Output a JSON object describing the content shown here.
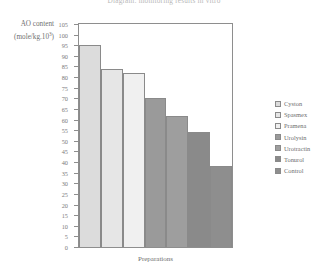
{
  "chart_data": {
    "type": "bar",
    "title": "Diagram: monitoring results in vitro",
    "xlabel": "Preparations",
    "ylabel_line1": "AO content",
    "ylabel_line2_prefix": "(mole/kg.10",
    "ylabel_line2_exp": "3",
    "ylabel_line2_suffix": ")",
    "categories": [
      "Cyston",
      "Spasmex",
      "Pramena",
      "Urolysin",
      "Urotractin",
      "Tonurol",
      "Control"
    ],
    "values": [
      95,
      84,
      82,
      70,
      61.5,
      54,
      38
    ],
    "colors": [
      "#dcdcdc",
      "#e6e6e6",
      "#f0f0f0",
      "#9a9a9a",
      "#9e9e9e",
      "#8a8a8a",
      "#8e8e8e"
    ],
    "ylim": [
      0,
      105
    ],
    "ytick_step": 5,
    "yticks": [
      105,
      100,
      95,
      90,
      85,
      80,
      75,
      70,
      65,
      60,
      55,
      50,
      45,
      40,
      35,
      30,
      25,
      20,
      15,
      10,
      5,
      0
    ],
    "grid": false,
    "legend_position": "right",
    "legend": [
      {
        "label": "Cyston",
        "color": "#dcdcdc"
      },
      {
        "label": "Spasmex",
        "color": "#e6e6e6"
      },
      {
        "label": "Pramena",
        "color": "#f0f0f0"
      },
      {
        "label": "Urolysin",
        "color": "#9a9a9a"
      },
      {
        "label": "Urotractin",
        "color": "#9e9e9e"
      },
      {
        "label": "Tonurol",
        "color": "#8a8a8a"
      },
      {
        "label": "Control",
        "color": "#8e8e8e"
      }
    ]
  }
}
